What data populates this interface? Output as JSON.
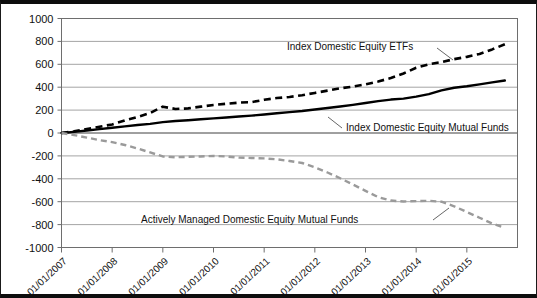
{
  "chart_data": {
    "type": "line",
    "title": "",
    "xlabel": "",
    "ylabel": "",
    "grid": true,
    "legend_position": "inline-annotations",
    "ylim": [
      -1000,
      1000
    ],
    "ytick_labels": [
      "1000",
      "800",
      "600",
      "400",
      "200",
      "0",
      "-200",
      "-400",
      "-600",
      "-800",
      "-1000"
    ],
    "ytick_values": [
      1000,
      800,
      600,
      400,
      200,
      0,
      -200,
      -400,
      -600,
      -800,
      -1000
    ],
    "xtick_labels": [
      "01/01/2007",
      "01/01/2008",
      "01/01/2009",
      "01/01/2010",
      "01/01/2011",
      "01/01/2012",
      "01/01/2013",
      "01/01/2014",
      "01/01/2015"
    ],
    "x": [
      2007.0,
      2007.25,
      2007.5,
      2007.75,
      2008.0,
      2008.25,
      2008.5,
      2008.75,
      2009.0,
      2009.25,
      2009.5,
      2009.75,
      2010.0,
      2010.25,
      2010.5,
      2010.75,
      2011.0,
      2011.25,
      2011.5,
      2011.75,
      2012.0,
      2012.25,
      2012.5,
      2012.75,
      2013.0,
      2013.25,
      2013.5,
      2013.75,
      2014.0,
      2014.25,
      2014.5,
      2014.75,
      2015.0,
      2015.25,
      2015.5,
      2015.75
    ],
    "series": [
      {
        "name": "Index Domestic Equity ETFs",
        "color": "#000000",
        "style": "dashed",
        "values": [
          0,
          15,
          35,
          55,
          75,
          110,
          140,
          175,
          230,
          210,
          215,
          230,
          245,
          255,
          265,
          270,
          290,
          305,
          315,
          330,
          350,
          370,
          390,
          405,
          425,
          450,
          480,
          520,
          570,
          600,
          620,
          645,
          665,
          690,
          730,
          775
        ]
      },
      {
        "name": "Index Domestic Equity Mutual Funds",
        "color": "#000000",
        "style": "solid",
        "values": [
          0,
          10,
          22,
          34,
          46,
          58,
          70,
          80,
          95,
          105,
          112,
          120,
          128,
          136,
          144,
          152,
          162,
          172,
          182,
          192,
          205,
          218,
          232,
          246,
          262,
          278,
          292,
          300,
          318,
          340,
          372,
          395,
          408,
          425,
          442,
          458
        ]
      },
      {
        "name": "Actively Managed Domestic Equity Mutual Funds",
        "color": "#9a9a9a",
        "style": "dashed",
        "values": [
          0,
          -18,
          -40,
          -62,
          -80,
          -105,
          -135,
          -170,
          -205,
          -212,
          -208,
          -205,
          -200,
          -205,
          -215,
          -218,
          -222,
          -230,
          -245,
          -262,
          -300,
          -345,
          -395,
          -450,
          -505,
          -560,
          -590,
          -598,
          -595,
          -592,
          -600,
          -640,
          -690,
          -740,
          -790,
          -830
        ]
      }
    ],
    "annotations": [
      {
        "text": "Index Domestic Equity ETFs",
        "series": "Index Domestic Equity ETFs"
      },
      {
        "text": "Index Domestic Equity Mutual Funds",
        "series": "Index Domestic Equity Mutual Funds"
      },
      {
        "text": "Actively Managed Domestic Equity Mutual Funds",
        "series": "Actively Managed Domestic Equity Mutual Funds"
      }
    ]
  }
}
